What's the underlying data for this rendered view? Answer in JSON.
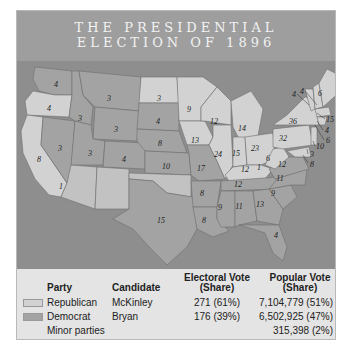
{
  "title": {
    "line1": "THE PRESIDENTIAL",
    "line2": "ELECTION OF 1896"
  },
  "colors": {
    "republican": "#d2d2d2",
    "democrat": "#a3a3a3",
    "non_voting": "#c2c2c2",
    "water": "#8e8e8e",
    "header": "#9e9e9e"
  },
  "map": {
    "legend_label": "Non-voting territory",
    "states": [
      {
        "abbr": "WA",
        "ev": "4",
        "party": "D"
      },
      {
        "abbr": "OR",
        "ev": "4",
        "party": "R"
      },
      {
        "abbr": "CA",
        "ev": "8",
        "party": "R"
      },
      {
        "abbr": "CA-1",
        "ev": "1",
        "party": "D"
      },
      {
        "abbr": "NV",
        "ev": "3",
        "party": "D"
      },
      {
        "abbr": "ID",
        "ev": "3",
        "party": "D"
      },
      {
        "abbr": "MT",
        "ev": "3",
        "party": "D"
      },
      {
        "abbr": "WY",
        "ev": "3",
        "party": "D"
      },
      {
        "abbr": "UT",
        "ev": "3",
        "party": "D"
      },
      {
        "abbr": "CO",
        "ev": "4",
        "party": "D"
      },
      {
        "abbr": "ND",
        "ev": "3",
        "party": "R"
      },
      {
        "abbr": "SD",
        "ev": "4",
        "party": "D"
      },
      {
        "abbr": "NE",
        "ev": "8",
        "party": "D"
      },
      {
        "abbr": "KS",
        "ev": "10",
        "party": "D"
      },
      {
        "abbr": "TX",
        "ev": "15",
        "party": "D"
      },
      {
        "abbr": "MN",
        "ev": "9",
        "party": "R"
      },
      {
        "abbr": "IA",
        "ev": "13",
        "party": "R"
      },
      {
        "abbr": "MO",
        "ev": "17",
        "party": "D"
      },
      {
        "abbr": "AR",
        "ev": "8",
        "party": "D"
      },
      {
        "abbr": "LA",
        "ev": "8",
        "party": "D"
      },
      {
        "abbr": "WI",
        "ev": "12",
        "party": "R"
      },
      {
        "abbr": "IL",
        "ev": "24",
        "party": "R"
      },
      {
        "abbr": "MI",
        "ev": "14",
        "party": "R"
      },
      {
        "abbr": "IN",
        "ev": "15",
        "party": "R"
      },
      {
        "abbr": "OH",
        "ev": "23",
        "party": "R"
      },
      {
        "abbr": "KY",
        "ev": "12",
        "party": "R"
      },
      {
        "abbr": "KY-1",
        "ev": "1",
        "party": "D"
      },
      {
        "abbr": "TN",
        "ev": "12",
        "party": "D"
      },
      {
        "abbr": "MS",
        "ev": "9",
        "party": "D"
      },
      {
        "abbr": "AL",
        "ev": "11",
        "party": "D"
      },
      {
        "abbr": "GA",
        "ev": "13",
        "party": "D"
      },
      {
        "abbr": "FL",
        "ev": "4",
        "party": "D"
      },
      {
        "abbr": "SC",
        "ev": "9",
        "party": "D"
      },
      {
        "abbr": "NC",
        "ev": "11",
        "party": "D"
      },
      {
        "abbr": "VA",
        "ev": "12",
        "party": "D"
      },
      {
        "abbr": "WV",
        "ev": "6",
        "party": "R"
      },
      {
        "abbr": "PA",
        "ev": "32",
        "party": "R"
      },
      {
        "abbr": "NY",
        "ev": "36",
        "party": "R"
      },
      {
        "abbr": "ME",
        "ev": "6",
        "party": "R"
      },
      {
        "abbr": "VT",
        "ev": "4",
        "party": "R"
      },
      {
        "abbr": "NH",
        "ev": "4",
        "party": "R"
      },
      {
        "abbr": "MA",
        "ev": "15",
        "party": "R"
      },
      {
        "abbr": "RI",
        "ev": "4",
        "party": "R"
      },
      {
        "abbr": "CT",
        "ev": "6",
        "party": "R"
      },
      {
        "abbr": "NJ",
        "ev": "10",
        "party": "R"
      },
      {
        "abbr": "DE",
        "ev": "3",
        "party": "R"
      },
      {
        "abbr": "MD",
        "ev": "8",
        "party": "R"
      }
    ]
  },
  "table": {
    "headers": {
      "party": "Party",
      "candidate": "Candidate",
      "electoral_1": "Electoral Vote",
      "electoral_2": "(Share)",
      "popular_1": "Popular Vote",
      "popular_2": "(Share)"
    },
    "rows": [
      {
        "party": "Republican",
        "candidate": "McKinley",
        "electoral": "271 (61%)",
        "popular": "7,104,779 (51%)"
      },
      {
        "party": "Democrat",
        "candidate": "Bryan",
        "electoral": "176 (39%)",
        "popular": "6,502,925 (47%)"
      },
      {
        "party": "Minor parties",
        "candidate": "",
        "electoral": "",
        "popular": "315,398 (2%)"
      }
    ]
  }
}
